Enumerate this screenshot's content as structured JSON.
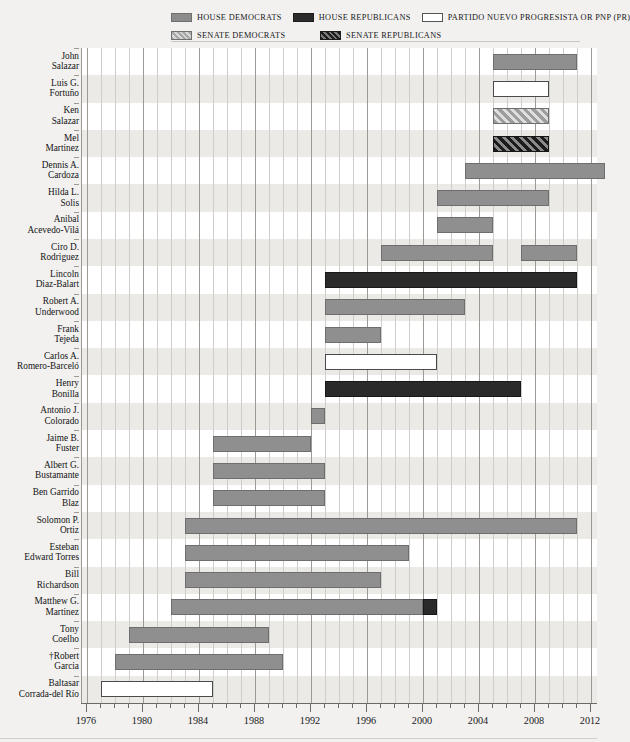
{
  "legend": {
    "items": [
      {
        "label": "HOUSE DEMOCRATS",
        "swatch": "house-dem",
        "color": "#8f8f8f"
      },
      {
        "label": "HOUSE REPUBLICANS",
        "swatch": "house-rep",
        "color": "#2a2a2a"
      },
      {
        "label": "PARTIDO NUEVO PROGRESISTA OR PNP (PR)",
        "swatch": "pnp",
        "color": "#ffffff"
      },
      {
        "label": "SENATE DEMOCRATS",
        "swatch": "senate-dem",
        "color": "#9d9d9d"
      },
      {
        "label": "SENATE REPUBLICANS",
        "swatch": "senate-rep",
        "color": "#1c1c1c"
      }
    ]
  },
  "axis": {
    "ticks": [
      "1976",
      "1980",
      "1984",
      "1988",
      "1992",
      "1996",
      "2000",
      "2004",
      "2008",
      "2012"
    ],
    "min": 1975,
    "max": 2012.5,
    "step_years": 1,
    "major_step_years": 4
  },
  "chart_data": {
    "type": "bar",
    "orientation": "horizontal",
    "subtype": "gantt-timeline",
    "title": "",
    "xlabel": "",
    "ylabel": "",
    "xlim": [
      1975,
      2012.5
    ],
    "grid": true,
    "legend_position": "top",
    "categories": [
      "John Salazar",
      "Luis G. Fortuño",
      "Ken Salazar",
      "Mel Martinez",
      "Dennis A. Cardoza",
      "Hilda L. Solis",
      "Anibal Acevedo-Vilá",
      "Ciro D. Rodriguez",
      "Lincoln Diaz-Balart",
      "Robert A. Underwood",
      "Frank Tejeda",
      "Carlos A. Romero-Barceló",
      "Henry Bonilla",
      "Antonio J. Colorado",
      "Jaime B. Fuster",
      "Albert G. Bustamante",
      "Ben Garrido Blaz",
      "Solomon P. Ortiz",
      "Esteban Edward Torres",
      "Bill Richardson",
      "Matthew G. Martinez",
      "Tony Coelho",
      "†Robert Garcia",
      "Baltasar Corrada-del Río"
    ],
    "members": [
      {
        "name_line1": "John",
        "name_line2": "Salazar",
        "terms": [
          {
            "start": 2005,
            "end": 2011,
            "type": "house-dem"
          }
        ]
      },
      {
        "name_line1": "Luis G.",
        "name_line2": "Fortuño",
        "terms": [
          {
            "start": 2005,
            "end": 2009,
            "type": "pnp"
          }
        ]
      },
      {
        "name_line1": "Ken",
        "name_line2": "Salazar",
        "terms": [
          {
            "start": 2005,
            "end": 2009,
            "type": "senate-dem"
          }
        ]
      },
      {
        "name_line1": "Mel",
        "name_line2": "Martinez",
        "terms": [
          {
            "start": 2005,
            "end": 2009,
            "type": "senate-rep"
          }
        ]
      },
      {
        "name_line1": "Dennis A.",
        "name_line2": "Cardoza",
        "terms": [
          {
            "start": 2003,
            "end": 2013,
            "type": "house-dem"
          }
        ]
      },
      {
        "name_line1": "Hilda L.",
        "name_line2": "Solis",
        "terms": [
          {
            "start": 2001,
            "end": 2009,
            "type": "house-dem"
          }
        ]
      },
      {
        "name_line1": "Anibal",
        "name_line2": "Acevedo-Vilá",
        "terms": [
          {
            "start": 2001,
            "end": 2005,
            "type": "house-dem"
          }
        ]
      },
      {
        "name_line1": "Ciro D.",
        "name_line2": "Rodriguez",
        "terms": [
          {
            "start": 1997,
            "end": 2005,
            "type": "house-dem"
          },
          {
            "start": 2007,
            "end": 2011,
            "type": "house-dem"
          }
        ]
      },
      {
        "name_line1": "Lincoln",
        "name_line2": "Diaz-Balart",
        "terms": [
          {
            "start": 1993,
            "end": 2011,
            "type": "house-rep"
          }
        ]
      },
      {
        "name_line1": "Robert A.",
        "name_line2": "Underwood",
        "terms": [
          {
            "start": 1993,
            "end": 2003,
            "type": "house-dem"
          }
        ]
      },
      {
        "name_line1": "Frank",
        "name_line2": "Tejeda",
        "terms": [
          {
            "start": 1993,
            "end": 1997,
            "type": "house-dem"
          }
        ]
      },
      {
        "name_line1": "Carlos A.",
        "name_line2": "Romero-Barceló",
        "terms": [
          {
            "start": 1993,
            "end": 2001,
            "type": "pnp"
          }
        ]
      },
      {
        "name_line1": "Henry",
        "name_line2": "Bonilla",
        "terms": [
          {
            "start": 1993,
            "end": 2007,
            "type": "house-rep"
          }
        ]
      },
      {
        "name_line1": "Antonio J.",
        "name_line2": "Colorado",
        "terms": [
          {
            "start": 1992,
            "end": 1993,
            "type": "house-dem"
          }
        ]
      },
      {
        "name_line1": "Jaime B.",
        "name_line2": "Fuster",
        "terms": [
          {
            "start": 1985,
            "end": 1992,
            "type": "house-dem"
          }
        ]
      },
      {
        "name_line1": "Albert G.",
        "name_line2": "Bustamante",
        "terms": [
          {
            "start": 1985,
            "end": 1993,
            "type": "house-dem"
          }
        ]
      },
      {
        "name_line1": "Ben Garrido",
        "name_line2": "Blaz",
        "terms": [
          {
            "start": 1985,
            "end": 1993,
            "type": "house-dem"
          }
        ]
      },
      {
        "name_line1": "Solomon P.",
        "name_line2": "Ortiz",
        "terms": [
          {
            "start": 1983,
            "end": 2011,
            "type": "house-dem"
          }
        ]
      },
      {
        "name_line1": "Esteban",
        "name_line2": "Edward Torres",
        "terms": [
          {
            "start": 1983,
            "end": 1999,
            "type": "house-dem"
          }
        ]
      },
      {
        "name_line1": "Bill",
        "name_line2": "Richardson",
        "terms": [
          {
            "start": 1983,
            "end": 1997,
            "type": "house-dem"
          }
        ]
      },
      {
        "name_line1": "Matthew G.",
        "name_line2": "Martinez",
        "terms": [
          {
            "start": 1982,
            "end": 2000,
            "type": "house-dem"
          },
          {
            "start": 2000,
            "end": 2001,
            "type": "house-rep"
          }
        ]
      },
      {
        "name_line1": "Tony",
        "name_line2": "Coelho",
        "terms": [
          {
            "start": 1979,
            "end": 1989,
            "type": "house-dem"
          }
        ]
      },
      {
        "name_line1": "†Robert",
        "name_line2": "Garcia",
        "terms": [
          {
            "start": 1978,
            "end": 1990,
            "type": "house-dem"
          }
        ]
      },
      {
        "name_line1": "Baltasar",
        "name_line2": "Corrada-del Río",
        "terms": [
          {
            "start": 1977,
            "end": 1985,
            "type": "pnp"
          }
        ]
      }
    ]
  }
}
